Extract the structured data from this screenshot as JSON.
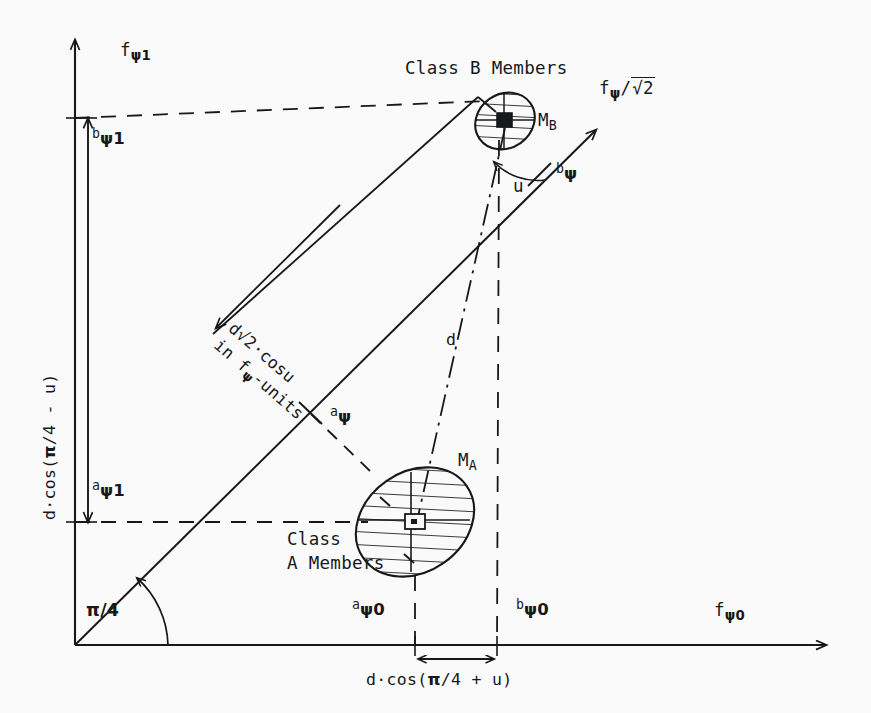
{
  "diagram": {
    "title_alt": "Two-class feature space diagram with rotated psi axes",
    "background_color": "#fafafa",
    "ink_color": "#16181a"
  },
  "axes": {
    "y_label": "fψ1",
    "y_label_base": "f",
    "y_label_sub": "ψ1",
    "x_label_base": "f",
    "x_label_sub": "ψ0",
    "diag_label": "fψ/√2",
    "diag_label_base": "f",
    "diag_label_sub": "ψ",
    "diag_label_tail": "/",
    "diag_label_radicand": "2",
    "angle_label": "π/4"
  },
  "ticks": {
    "b_psi1_pre": "b",
    "b_psi1_sub": "ψ1",
    "a_psi1_pre": "a",
    "a_psi1_sub": "ψ1",
    "a_psi0_pre": "a",
    "a_psi0_sub": "ψ0",
    "b_psi0_pre": "b",
    "b_psi0_sub": "ψ0",
    "a_psi_pre": "a",
    "a_psi_sub": "ψ",
    "b_psi_pre": "b",
    "b_psi_sub": "ψ"
  },
  "clusters": {
    "class_b_label": "Class B Members",
    "class_a_label_line1": "Class",
    "class_a_label_line2": "A Members",
    "mean_b_base": "M",
    "mean_b_sub": "B",
    "mean_a_base": "M",
    "mean_a_sub": "A"
  },
  "measures": {
    "vertical_bracket": "d·cos(π/4 - u)",
    "vertical_bracket_pre": "d·cos(",
    "vertical_bracket_pi": "π",
    "vertical_bracket_post": "/4 - u)",
    "horizontal_bracket_pre": "d·cos(",
    "horizontal_bracket_pi": "π",
    "horizontal_bracket_post": "/4 + u)",
    "diag_arrow_line1": "d√2·cosu",
    "diag_arrow_line2": "in fψ-units",
    "diag_arrow_line2_pre": "in f",
    "diag_arrow_line2_sub": "ψ",
    "diag_arrow_line2_post": "-units",
    "distance_d": "d",
    "angle_u": "u"
  }
}
